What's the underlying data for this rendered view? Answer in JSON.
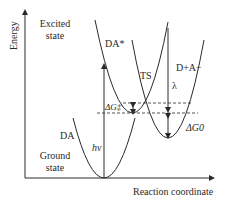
{
  "axes": {
    "y_label": "Energy",
    "x_label": "Reaction coordinate"
  },
  "states": {
    "excited_line1": "Excited",
    "excited_line2": "state",
    "ground_line1": "Ground",
    "ground_line2": "state"
  },
  "curves": {
    "ground": "DA",
    "excited": "DA*",
    "charge_transfer": "D+A−",
    "transition_state": "TS"
  },
  "annotations": {
    "excitation": "hν",
    "reorganization": "λ",
    "activation": "ΔG‡",
    "driving_force": "ΔG0"
  },
  "colors": {
    "line": "#2a2a2a",
    "background": "#ffffff"
  }
}
